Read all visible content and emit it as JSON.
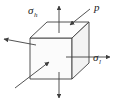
{
  "figure": {
    "type": "engineering-stress-element",
    "background_color": "#ffffff",
    "line_color": "#3f3f3f",
    "text_color": "#1a1a1a"
  },
  "labels": {
    "hoop_stress": {
      "symbol": "σ",
      "subscript": "h",
      "name": "hoop-stress"
    },
    "longitudinal_stress": {
      "symbol": "σ",
      "subscript": "l",
      "name": "longitudinal-stress"
    },
    "pressure": {
      "symbol": "p",
      "subscript": "",
      "name": "internal-pressure"
    }
  },
  "cube": {
    "description": "isometric cube element",
    "front_face": "visible shaded front square",
    "top_face": "visible top parallelogram",
    "right_face": "visible right parallelogram"
  },
  "arrows": [
    {
      "name": "hoop-stress-up-arrow",
      "label": "σh",
      "direction": "up",
      "position": "top"
    },
    {
      "name": "hoop-stress-down-arrow",
      "label": "σh",
      "direction": "down",
      "position": "bottom"
    },
    {
      "name": "longitudinal-right-arrow",
      "label": "σl",
      "direction": "right",
      "position": "right"
    },
    {
      "name": "longitudinal-left-arrow",
      "label": "σl",
      "direction": "left",
      "position": "left"
    },
    {
      "name": "pressure-top-arrow",
      "label": "p",
      "direction": "down-left",
      "position": "top-right"
    },
    {
      "name": "pressure-front-arrow",
      "label": "p",
      "direction": "up-right",
      "position": "bottom-left"
    }
  ]
}
